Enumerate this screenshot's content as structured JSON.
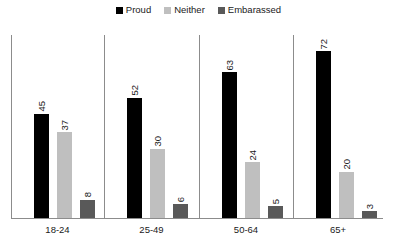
{
  "chart_data": {
    "type": "bar",
    "title": "",
    "subtitle": "",
    "xlabel": "",
    "ylabel": "",
    "ylim": [
      0,
      80
    ],
    "grid": false,
    "legend_position": "top-center",
    "categories": [
      "18-24",
      "25-49",
      "50-64",
      "65+"
    ],
    "series": [
      {
        "name": "Proud",
        "color": "#000000",
        "values": [
          45,
          52,
          63,
          72
        ]
      },
      {
        "name": "Neither",
        "color": "#bfbfbf",
        "values": [
          37,
          30,
          24,
          20
        ]
      },
      {
        "name": "Embarassed",
        "color": "#595959",
        "values": [
          8,
          6,
          5,
          3
        ]
      }
    ],
    "value_labels": true,
    "value_label_orientation": "vertical",
    "axis_color": "#8c8c8c",
    "background_color": "#ffffff"
  },
  "legend": {
    "items": [
      {
        "label": "Proud"
      },
      {
        "label": "Neither"
      },
      {
        "label": "Embarassed"
      }
    ]
  },
  "groups": [
    {
      "label": "18-24",
      "bars": [
        {
          "series": "Proud",
          "value": "45"
        },
        {
          "series": "Neither",
          "value": "37"
        },
        {
          "series": "Embarassed",
          "value": "8"
        }
      ]
    },
    {
      "label": "25-49",
      "bars": [
        {
          "series": "Proud",
          "value": "52"
        },
        {
          "series": "Neither",
          "value": "30"
        },
        {
          "series": "Embarassed",
          "value": "6"
        }
      ]
    },
    {
      "label": "50-64",
      "bars": [
        {
          "series": "Proud",
          "value": "63"
        },
        {
          "series": "Neither",
          "value": "24"
        },
        {
          "series": "Embarassed",
          "value": "5"
        }
      ]
    },
    {
      "label": "65+",
      "bars": [
        {
          "series": "Proud",
          "value": "72"
        },
        {
          "series": "Neither",
          "value": "20"
        },
        {
          "series": "Embarassed",
          "value": "3"
        }
      ]
    }
  ]
}
